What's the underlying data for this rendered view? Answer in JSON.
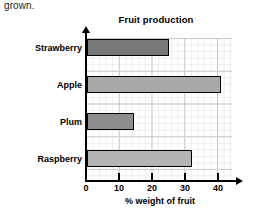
{
  "intro_text": "grown.",
  "chart_data": {
    "type": "bar",
    "orientation": "horizontal",
    "title": "Fruit production",
    "xlabel": "% weight of fruit",
    "ylabel": "",
    "categories": [
      "Strawberry",
      "Apple",
      "Plum",
      "Raspberry"
    ],
    "values": [
      25,
      41,
      14.5,
      32
    ],
    "xlim": [
      0,
      44
    ],
    "xticks": [
      0,
      10,
      20,
      30,
      40
    ],
    "xtick_labels": [
      "0",
      "10",
      "20",
      "30",
      "40"
    ],
    "grid": "minor grid every 2 units, major grid every 10 units",
    "legend": "none",
    "bar_colors": [
      "#787878",
      "#a8a8a8",
      "#8c8c8c",
      "#b4b4b4"
    ],
    "bar_edge_color": "#000000",
    "grid_color": "#c9c9c9",
    "axis_color": "#000000"
  }
}
